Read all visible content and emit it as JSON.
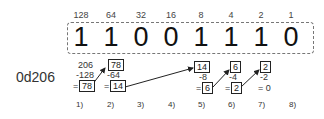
{
  "weights": [
    "128",
    "64",
    "32",
    "16",
    "8",
    "4",
    "2",
    "1"
  ],
  "bits": [
    "1",
    "1",
    "0",
    "0",
    "1",
    "1",
    "1",
    "0"
  ],
  "decimal_label": "0d206",
  "calc": {
    "s1": {
      "top": "206",
      "sub": "-128",
      "eq": "=",
      "result": "78"
    },
    "s2": {
      "top": "78",
      "sub": "-64",
      "eq": "=",
      "result": "14"
    },
    "s5": {
      "top": "14",
      "sub": "-8",
      "eq": "=",
      "result": "6"
    },
    "s6": {
      "top": "6",
      "sub": "-4",
      "eq": "=",
      "result": "2"
    },
    "s7": {
      "top": "2",
      "sub": "-2",
      "eq": "= 0"
    }
  },
  "steps": [
    "1)",
    "2)",
    "3)",
    "4)",
    "5)",
    "6)",
    "7)",
    "8)"
  ]
}
